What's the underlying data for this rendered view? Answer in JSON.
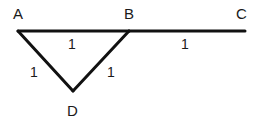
{
  "diagram": {
    "type": "graph",
    "nodes": [
      {
        "id": "A",
        "label": "A"
      },
      {
        "id": "B",
        "label": "B"
      },
      {
        "id": "C",
        "label": "C"
      },
      {
        "id": "D",
        "label": "D"
      }
    ],
    "edges": [
      {
        "from": "A",
        "to": "B",
        "weight": "1"
      },
      {
        "from": "B",
        "to": "C",
        "weight": "1"
      },
      {
        "from": "A",
        "to": "D",
        "weight": "1"
      },
      {
        "from": "B",
        "to": "D",
        "weight": "1"
      }
    ],
    "colors": {
      "line": "#111111",
      "text": "#1a1a1a",
      "background": "#ffffff"
    }
  }
}
